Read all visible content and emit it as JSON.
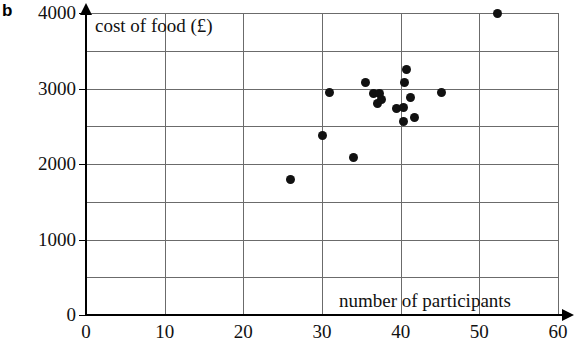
{
  "part_label": "b",
  "chart_data": {
    "type": "scatter",
    "title": "",
    "xlabel": "number of participants",
    "ylabel": "cost of food (£)",
    "xlim": [
      0,
      60
    ],
    "ylim": [
      0,
      4000
    ],
    "xticks": [
      0,
      10,
      20,
      30,
      40,
      50,
      60
    ],
    "xtick_labels": [
      "0",
      "10",
      "20",
      "30",
      "40",
      "50",
      "60"
    ],
    "yticks": [
      0,
      1000,
      2000,
      3000,
      4000
    ],
    "ytick_labels": [
      "0",
      "1000",
      "2000",
      "3000",
      "4000"
    ],
    "grid": true,
    "grid_x_step": 10,
    "grid_y_step": 500,
    "legend": null,
    "marker": "filled-circle",
    "marker_color": "#111111",
    "points": [
      {
        "x": 26.0,
        "y": 1800
      },
      {
        "x": 30.0,
        "y": 2380
      },
      {
        "x": 31.0,
        "y": 2950
      },
      {
        "x": 34.0,
        "y": 2080
      },
      {
        "x": 35.5,
        "y": 3080
      },
      {
        "x": 36.5,
        "y": 2930
      },
      {
        "x": 37.3,
        "y": 2930
      },
      {
        "x": 37.0,
        "y": 2800
      },
      {
        "x": 37.6,
        "y": 2850
      },
      {
        "x": 39.5,
        "y": 2730
      },
      {
        "x": 40.3,
        "y": 2750
      },
      {
        "x": 40.3,
        "y": 2560
      },
      {
        "x": 40.8,
        "y": 3250
      },
      {
        "x": 40.5,
        "y": 3080
      },
      {
        "x": 41.3,
        "y": 2880
      },
      {
        "x": 41.8,
        "y": 2610
      },
      {
        "x": 45.2,
        "y": 2950
      },
      {
        "x": 52.3,
        "y": 4000
      }
    ]
  }
}
